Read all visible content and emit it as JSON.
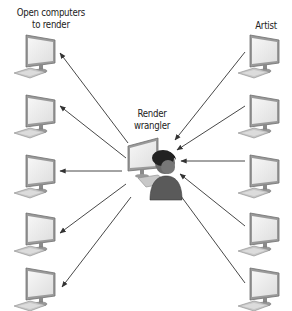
{
  "diagram": {
    "labels": {
      "left_group_line1": "Open computers",
      "left_group_line2": "to render",
      "right_group": "Artist",
      "center_line1": "Render",
      "center_line2": "wrangler"
    },
    "nodes": {
      "left_computers": [
        {
          "id": "open-computer-1"
        },
        {
          "id": "open-computer-2"
        },
        {
          "id": "open-computer-3"
        },
        {
          "id": "open-computer-4"
        },
        {
          "id": "open-computer-5"
        }
      ],
      "right_computers": [
        {
          "id": "artist-computer-1"
        },
        {
          "id": "artist-computer-2"
        },
        {
          "id": "artist-computer-3"
        },
        {
          "id": "artist-computer-4"
        },
        {
          "id": "artist-computer-5"
        }
      ],
      "center": {
        "id": "render-wrangler",
        "icons": [
          "monitor-icon",
          "person-icon"
        ]
      }
    },
    "edges": {
      "from_artists_to_wrangler": 5,
      "from_wrangler_to_open_computers": 5
    },
    "colors": {
      "line": "#333333",
      "monitor_frame": "#8a8a8a",
      "monitor_screen": "#efefef",
      "person": "#555555",
      "person_hair": "#1a1a1a"
    }
  }
}
